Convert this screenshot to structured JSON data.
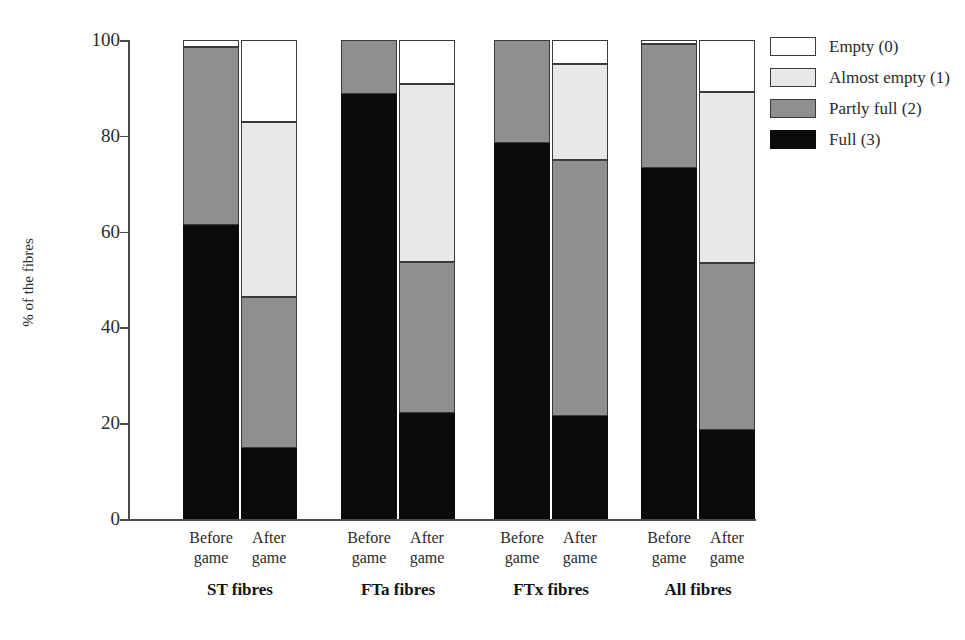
{
  "chart_data": {
    "type": "bar",
    "subtype": "stacked-bar-100",
    "title": "",
    "xlabel": "",
    "ylabel": "% of the fibres",
    "ylim": [
      0,
      100
    ],
    "yticks": [
      0,
      20,
      40,
      60,
      80,
      100
    ],
    "ytick_labels": [
      "0",
      "20",
      "40",
      "60",
      "80",
      "100"
    ],
    "grid": false,
    "legend_position": "right",
    "categories": [
      "ST fibres Before game",
      "ST fibres After game",
      "FTa fibres Before game",
      "FTa fibres After game",
      "FTx fibres Before game",
      "FTx fibres After game",
      "All fibres Before game",
      "All fibres After game"
    ],
    "series": [
      {
        "name": "Full (3)",
        "color": "#0b0b0b",
        "values": [
          61.4,
          14.8,
          88.7,
          22.1,
          78.5,
          21.5,
          73.3,
          18.5
        ]
      },
      {
        "name": "Partly full (2)",
        "color": "#8f8f8f",
        "values": [
          37.2,
          31.5,
          11.3,
          31.6,
          21.5,
          53.5,
          25.8,
          35.0
        ]
      },
      {
        "name": "Almost empty (1)",
        "color": "#e8e8e8",
        "values": [
          0.0,
          36.6,
          0.0,
          37.1,
          0.0,
          19.9,
          0.0,
          35.7
        ]
      },
      {
        "name": "Empty (0)",
        "color": "#ffffff",
        "values": [
          1.4,
          17.1,
          0.0,
          9.2,
          0.0,
          5.1,
          0.9,
          10.8
        ]
      }
    ],
    "cumulative_tops": {
      "note": "stack boundaries as % from bottom, order: full, +partly, +almost, +empty",
      "ST fibres Before game": [
        61.4,
        98.6,
        98.6,
        100
      ],
      "ST fibres After game": [
        14.8,
        46.3,
        82.9,
        100
      ],
      "FTa fibres Before game": [
        88.7,
        100,
        100,
        100
      ],
      "FTa fibres After game": [
        22.1,
        53.7,
        90.8,
        100
      ],
      "FTx fibres Before game": [
        78.5,
        100,
        100,
        100
      ],
      "FTx fibres After game": [
        21.5,
        75.0,
        94.9,
        100
      ],
      "All fibres Before game": [
        73.3,
        99.1,
        99.1,
        100
      ],
      "All fibres After game": [
        18.5,
        53.5,
        89.2,
        100
      ]
    }
  },
  "axis": {
    "y_title": "% of the fibres",
    "y_ticks": [
      "100",
      "80",
      "60",
      "40",
      "20",
      "0"
    ]
  },
  "groups": [
    {
      "label": "ST fibres",
      "bars": [
        {
          "line1": "Before",
          "line2": "game"
        },
        {
          "line1": "After",
          "line2": "game"
        }
      ]
    },
    {
      "label": "FTa fibres",
      "bars": [
        {
          "line1": "Before",
          "line2": "game"
        },
        {
          "line1": "After",
          "line2": "game"
        }
      ]
    },
    {
      "label": "FTx fibres",
      "bars": [
        {
          "line1": "Before",
          "line2": "game"
        },
        {
          "line1": "After",
          "line2": "game"
        }
      ]
    },
    {
      "label": "All fibres",
      "bars": [
        {
          "line1": "Before",
          "line2": "game"
        },
        {
          "line1": "After",
          "line2": "game"
        }
      ]
    }
  ],
  "legend": {
    "items": [
      {
        "label": "Empty (0)",
        "color": "#ffffff"
      },
      {
        "label": "Almost empty (1)",
        "color": "#e8e8e8"
      },
      {
        "label": "Partly full (2)",
        "color": "#8f8f8f"
      },
      {
        "label": "Full (3)",
        "color": "#0b0b0b"
      }
    ]
  }
}
